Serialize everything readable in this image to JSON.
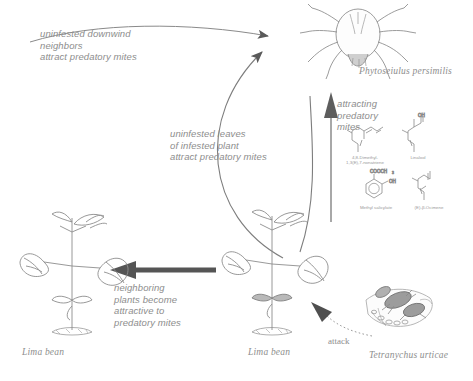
{
  "figure": {
    "type": "tritrophic-signalling-diagram",
    "background": "#ffffff",
    "ink_color": "#8d8d8d"
  },
  "annotations": {
    "downwind_neighbors": "uninfested downwind\nneighbors\nattract predatory mites",
    "uninfested_leaves": "uninfested leaves\nof infested plant\nattract predatory mites",
    "attracting_predatory_mites": "attracting\npredatory\nmites",
    "neighboring_plants": "neighboring\nplants become\nattractive to\npredatory mites",
    "attack": "attack"
  },
  "organisms": {
    "predator": "Phytoseiulus persimilis",
    "herbivore": "Tetranychus urticae",
    "plant_left": "Lima bean",
    "plant_right": "Lima bean"
  },
  "chemicals": [
    {
      "name": "4,8-Dimethyl-\n1,3(E),7-nonatriene",
      "structure": "acyclic-triene"
    },
    {
      "name": "Linalool",
      "structure": "acyclic-alcohol",
      "group": "OH"
    },
    {
      "name": "Methyl salicylate",
      "structure": "benzene-ring",
      "groups": [
        "COOCH",
        "OH"
      ],
      "subscript": "3"
    },
    {
      "name": "(E)-β-Ocimene",
      "structure": "acyclic-triene"
    }
  ]
}
